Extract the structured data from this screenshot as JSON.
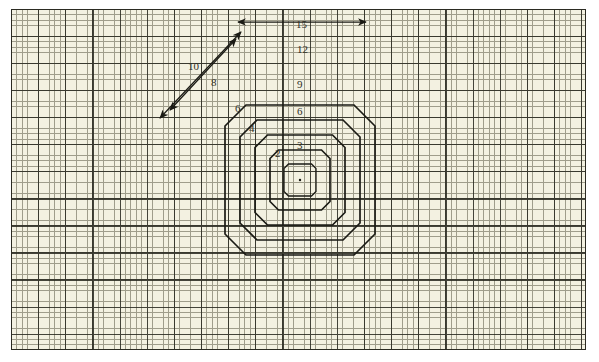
{
  "figure": {
    "background_color": "#f3f1e1",
    "grid_line_color": "#6d6b58",
    "grid_major_color": "#2b2b22",
    "stroke_color": "#1a1a14",
    "center": {
      "x": 300,
      "y": 180
    },
    "grid": {
      "minor_spacing_px": 5.4,
      "major_every_cells": 5,
      "area": {
        "x": 11,
        "y": 9,
        "width": 575,
        "height": 341
      }
    },
    "octagons": [
      {
        "name": "octagon-1-outer",
        "side_label": "15",
        "diagonal_label": "10",
        "flat_half_width": 75,
        "cut": 54,
        "stroke_width": 1.7
      },
      {
        "name": "octagon-2",
        "side_label": "12",
        "diagonal_label": "8",
        "flat_half_width": 60,
        "cut": 43,
        "stroke_width": 1.7
      },
      {
        "name": "octagon-3",
        "side_label": "9",
        "diagonal_label": "6",
        "flat_half_width": 45,
        "cut": 32.5,
        "stroke_width": 1.7
      },
      {
        "name": "octagon-4",
        "side_label": "6",
        "diagonal_label": "4",
        "flat_half_width": 30,
        "cut": 21.5,
        "stroke_width": 1.7
      },
      {
        "name": "octagon-5-inner",
        "side_label": "3",
        "diagonal_label": "2",
        "flat_half_width": 16,
        "cut": 11.5,
        "stroke_width": 1.3
      }
    ],
    "dimension_labels": {
      "horizontal": [
        {
          "value": "15",
          "x": 300,
          "y": 25
        },
        {
          "value": "12",
          "x": 301,
          "y": 50
        },
        {
          "value": "9",
          "x": 301,
          "y": 85
        },
        {
          "value": "6",
          "x": 301,
          "y": 112
        },
        {
          "value": "3",
          "x": 301,
          "y": 146
        }
      ],
      "diagonal": [
        {
          "value": "10",
          "x": 192,
          "y": 67
        },
        {
          "value": "8",
          "x": 215,
          "y": 83
        },
        {
          "value": "6",
          "x": 239,
          "y": 109
        },
        {
          "value": "4",
          "x": 253,
          "y": 129
        },
        {
          "value": "2",
          "x": 279,
          "y": 154
        }
      ]
    },
    "arrows": {
      "horizontal_extent": {
        "label": "15",
        "from_x": 238,
        "to_x": 366,
        "y": 22,
        "double_headed": true
      },
      "diagonal_extent": {
        "label": "10",
        "from": {
          "x": 160,
          "y": 118
        },
        "to": {
          "x": 241,
          "y": 32
        },
        "double_headed": true
      }
    },
    "center_dot": {
      "x": 300,
      "y": 180,
      "r": 1.2
    }
  }
}
